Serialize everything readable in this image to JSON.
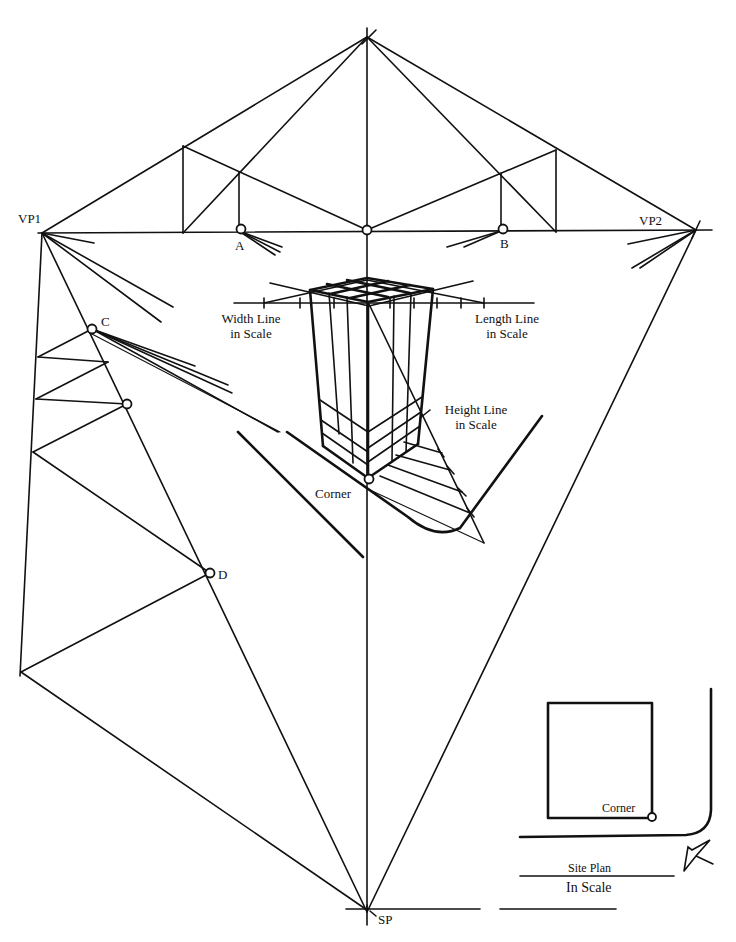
{
  "diagram": {
    "type": "two-point perspective construction",
    "labels": {
      "vp1": "VP1",
      "vp2": "VP2",
      "a": "A",
      "b": "B",
      "c": "C",
      "d": "D",
      "sp": "SP",
      "corner_main": "Corner",
      "corner_plan": "Corner",
      "width_line_1": "Width Line",
      "width_line_2": "in Scale",
      "length_line_1": "Length Line",
      "length_line_2": "in Scale",
      "height_line_1": "Height Line",
      "height_line_2": "in Scale",
      "site_plan": "Site Plan",
      "in_scale": "In Scale"
    },
    "colors": {
      "ink": "#111111",
      "paper": "#ffffff"
    }
  }
}
